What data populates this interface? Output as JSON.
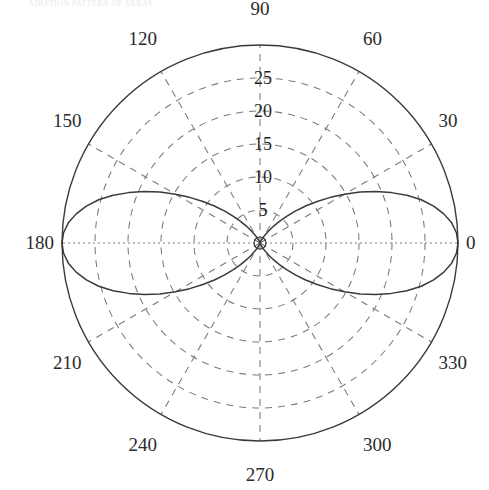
{
  "caption": {
    "text": "ADIATION PATTERN OF ARRAY"
  },
  "chart_data": {
    "type": "line",
    "subtype": "polar",
    "title": "",
    "xlabel": "",
    "ylabel": "",
    "grid": true,
    "legend": null,
    "angle_unit": "degrees",
    "angle_tick_labels": [
      "0",
      "30",
      "60",
      "90",
      "120",
      "150",
      "180",
      "210",
      "240",
      "270",
      "300",
      "330"
    ],
    "angle_ticks": [
      0,
      30,
      60,
      90,
      120,
      150,
      180,
      210,
      240,
      270,
      300,
      330
    ],
    "radial_tick_labels": [
      "5",
      "10",
      "15",
      "20",
      "25"
    ],
    "radial_ticks": [
      5,
      10,
      15,
      20,
      25
    ],
    "rlim": [
      0,
      30
    ],
    "radial_label_angle": 90,
    "series": [
      {
        "name": "array pattern",
        "color": "#3a3a3a",
        "theta": [
          0,
          3,
          6,
          9,
          12,
          15,
          18,
          21,
          24,
          27,
          30,
          33,
          36,
          39,
          42,
          45,
          48,
          51,
          54,
          57,
          60,
          63,
          66,
          69,
          72,
          75,
          78,
          81,
          84,
          87,
          90,
          93,
          96,
          99,
          102,
          105,
          108,
          111,
          114,
          117,
          120,
          123,
          126,
          129,
          132,
          135,
          138,
          141,
          144,
          147,
          150,
          153,
          156,
          159,
          162,
          165,
          168,
          171,
          174,
          177,
          180,
          183,
          186,
          189,
          192,
          195,
          198,
          201,
          204,
          207,
          210,
          213,
          216,
          219,
          222,
          225,
          228,
          231,
          234,
          237,
          240,
          243,
          246,
          249,
          252,
          255,
          258,
          261,
          264,
          267,
          270,
          273,
          276,
          279,
          282,
          285,
          288,
          291,
          294,
          297,
          300,
          303,
          306,
          309,
          312,
          315,
          318,
          321,
          324,
          327,
          330,
          333,
          336,
          339,
          342,
          345,
          348,
          351,
          354,
          357,
          360
        ],
        "r": [
          30.0,
          29.8,
          29.2,
          28.2,
          26.9,
          25.3,
          23.4,
          21.3,
          19.2,
          17.0,
          14.8,
          12.7,
          10.7,
          8.9,
          7.2,
          5.7,
          4.4,
          3.3,
          2.4,
          1.6,
          1.1,
          0.7,
          0.4,
          0.2,
          0.1,
          0.05,
          0.02,
          0.01,
          0.0,
          0.0,
          0.0,
          0.0,
          0.0,
          0.01,
          0.02,
          0.05,
          0.1,
          0.2,
          0.4,
          0.7,
          1.1,
          1.6,
          2.4,
          3.3,
          4.4,
          5.7,
          7.2,
          8.9,
          10.7,
          12.7,
          14.8,
          17.0,
          19.2,
          21.3,
          23.4,
          25.3,
          26.9,
          28.2,
          29.2,
          29.8,
          30.0,
          29.8,
          29.2,
          28.2,
          26.9,
          25.3,
          23.4,
          21.3,
          19.2,
          17.0,
          14.8,
          12.7,
          10.7,
          8.9,
          7.2,
          5.7,
          4.4,
          3.3,
          2.4,
          1.6,
          1.1,
          0.7,
          0.4,
          0.2,
          0.1,
          0.05,
          0.02,
          0.01,
          0.0,
          0.0,
          0.0,
          0.0,
          0.0,
          0.01,
          0.02,
          0.05,
          0.1,
          0.2,
          0.4,
          0.7,
          1.1,
          1.6,
          2.4,
          3.3,
          4.4,
          5.7,
          7.2,
          8.9,
          10.7,
          12.7,
          14.8,
          17.0,
          19.2,
          21.3,
          23.4,
          25.3,
          26.9,
          28.2,
          29.2,
          29.8,
          30.0
        ]
      }
    ],
    "origin_marker": {
      "shape": "circle",
      "r_px": 6
    }
  },
  "colors": {
    "outline": "#3a3a3a",
    "grid": "#7a7a7a",
    "curve": "#3a3a3a",
    "text": "#2b2b2b",
    "background": "#ffffff"
  }
}
